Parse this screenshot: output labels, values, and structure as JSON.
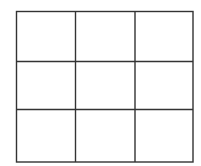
{
  "grid": {
    "rows": 3,
    "cols": 3,
    "left": 16.5,
    "right": 193,
    "top": 11.5,
    "bottom": 162,
    "col_lines": [
      75.5,
      135
    ],
    "row_lines": [
      61.5,
      109.5
    ],
    "line_color": "#333333",
    "line_width": 1.4,
    "background": "#ffffff"
  }
}
